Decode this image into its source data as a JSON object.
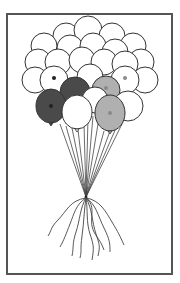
{
  "illustration": {
    "subject": "balloon-bunch",
    "frame_color": "#555555",
    "outline_color": "#333333",
    "colors": {
      "white": "#ffffff",
      "dark": "#4a4a4a",
      "light": "#b0b0b0",
      "dot_dark": "#222222",
      "dot_light": "#8a8a8a"
    },
    "knot": {
      "x": 86,
      "y": 197
    },
    "back_balloons": [
      {
        "cx": 66,
        "cy": 36,
        "r": 13
      },
      {
        "cx": 88,
        "cy": 30,
        "r": 14
      },
      {
        "cx": 112,
        "cy": 36,
        "r": 13
      },
      {
        "cx": 44,
        "cy": 46,
        "r": 13
      },
      {
        "cx": 133,
        "cy": 46,
        "r": 13
      },
      {
        "cx": 70,
        "cy": 48,
        "r": 13
      },
      {
        "cx": 93,
        "cy": 46,
        "r": 13
      },
      {
        "cx": 115,
        "cy": 52,
        "r": 13
      },
      {
        "cx": 38,
        "cy": 62,
        "r": 13
      },
      {
        "cx": 141,
        "cy": 62,
        "r": 13
      },
      {
        "cx": 58,
        "cy": 62,
        "r": 13
      },
      {
        "cx": 82,
        "cy": 60,
        "r": 13
      },
      {
        "cx": 104,
        "cy": 62,
        "r": 13
      },
      {
        "cx": 125,
        "cy": 64,
        "r": 13
      },
      {
        "cx": 35,
        "cy": 80,
        "r": 13
      },
      {
        "cx": 145,
        "cy": 80,
        "r": 13
      },
      {
        "cx": 90,
        "cy": 77,
        "r": 13
      }
    ],
    "mid_balloons": [
      {
        "cx": 54,
        "cy": 80,
        "r": 14,
        "fill": "white",
        "dot": "dark"
      },
      {
        "cx": 125,
        "cy": 80,
        "r": 14,
        "fill": "white",
        "dot": "light"
      },
      {
        "cx": 106,
        "cy": 90,
        "r": 14,
        "fill": "light",
        "dot": "light"
      },
      {
        "cx": 75,
        "cy": 92,
        "r": 15,
        "fill": "dark",
        "dot": "none"
      },
      {
        "cx": 128,
        "cy": 106,
        "r": 15,
        "fill": "white",
        "dot": "none"
      },
      {
        "cx": 95,
        "cy": 100,
        "r": 13,
        "fill": "white",
        "dot": "none"
      }
    ],
    "front_balloons": [
      {
        "cx": 51,
        "cy": 106,
        "rx": 15,
        "ry": 17,
        "fill": "dark",
        "dot": "dark"
      },
      {
        "cx": 77,
        "cy": 112,
        "rx": 15,
        "ry": 17,
        "fill": "white",
        "dot": "none"
      },
      {
        "cx": 110,
        "cy": 113,
        "rx": 15,
        "ry": 18,
        "fill": "light",
        "dot": "light"
      }
    ],
    "string_tops": [
      {
        "x": 60,
        "y": 124
      },
      {
        "x": 66,
        "y": 126
      },
      {
        "x": 72,
        "y": 128
      },
      {
        "x": 78,
        "y": 130
      },
      {
        "x": 84,
        "y": 124
      },
      {
        "x": 88,
        "y": 118
      },
      {
        "x": 93,
        "y": 116
      },
      {
        "x": 98,
        "y": 124
      },
      {
        "x": 104,
        "y": 131
      },
      {
        "x": 110,
        "y": 131
      },
      {
        "x": 116,
        "y": 128
      },
      {
        "x": 122,
        "y": 124
      }
    ],
    "tails": [
      "M86 198 C 70 200, 66 212, 58 220 S 52 230, 48 236",
      "M86 198 C 76 204, 74 214, 70 224 S 64 240, 60 247",
      "M86 198 C 80 208, 80 220, 76 232 S 74 246, 72 256",
      "M86 198 C 84 210, 84 222, 82 236 S 82 250, 80 258",
      "M86 198 C 88 210, 86 222, 90 234 S 94 248, 92 260",
      "M86 198 C 92 208, 92 222, 96 234 S 100 246, 98 256",
      "M86 198 C 96 204, 98 216, 104 228 S 110 244, 110 252",
      "M86 198 C 100 200, 106 212, 112 222 S 120 236, 124 245",
      "M86 198 C 96 206, 90 216, 92 226 S 100 238, 104 250"
    ]
  }
}
